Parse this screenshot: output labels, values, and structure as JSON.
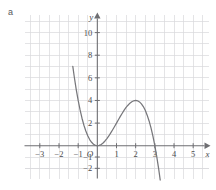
{
  "figure": {
    "part_label": "a"
  },
  "chart_data": {
    "type": "line",
    "title": "",
    "subtitle": "",
    "xlabel": "x",
    "ylabel": "y",
    "origin_label": "O",
    "grid": true,
    "legend": null,
    "xlim": [
      -3.8,
      5.8
    ],
    "ylim": [
      -2.9,
      11.6
    ],
    "xticks": [
      -3,
      -2,
      -1,
      1,
      2,
      3,
      4,
      5
    ],
    "xticklabels": [
      "−3",
      "−2",
      "−1",
      "1",
      "2",
      "3",
      "4",
      "5"
    ],
    "yticks": [
      -2,
      -1,
      2,
      4,
      6,
      8,
      10
    ],
    "yticklabels": [
      "−2",
      "−1",
      "2",
      "4",
      "6",
      "8",
      "10"
    ],
    "x_gridlines": [
      -3.5,
      -2.5,
      -1.5,
      -0.5,
      0.5,
      1.5,
      2.5,
      3.5,
      4.5,
      5.5
    ],
    "y_gridlines": [
      -2,
      1,
      3,
      5,
      7,
      9,
      11
    ],
    "series": [
      {
        "name": "y = x²(3 − x)",
        "expression": "3*x^2 - x^3",
        "color": "#77777b",
        "roots": [
          0,
          3
        ],
        "local_minimum": [
          0,
          0
        ],
        "local_maximum": [
          2,
          4
        ],
        "x": [
          -1.28,
          -1.2,
          -1.1,
          -1.0,
          -0.9,
          -0.8,
          -0.7,
          -0.6,
          -0.5,
          -0.4,
          -0.3,
          -0.2,
          -0.1,
          0.0,
          0.1,
          0.2,
          0.3,
          0.4,
          0.5,
          0.6,
          0.7,
          0.8,
          0.9,
          1.0,
          1.1,
          1.2,
          1.3,
          1.4,
          1.5,
          1.6,
          1.7,
          1.8,
          1.9,
          2.0,
          2.1,
          2.2,
          2.3,
          2.4,
          2.5,
          2.6,
          2.7,
          2.8,
          2.9,
          3.0,
          3.1,
          3.2,
          3.3,
          3.4,
          3.5,
          3.55
        ],
        "y": [
          7.01,
          6.05,
          4.96,
          4.0,
          3.16,
          2.43,
          1.81,
          1.3,
          0.88,
          0.54,
          0.3,
          0.13,
          0.03,
          0.0,
          0.03,
          0.11,
          0.24,
          0.42,
          0.63,
          0.86,
          1.13,
          1.41,
          1.7,
          2.0,
          2.3,
          2.59,
          2.87,
          3.14,
          3.38,
          3.58,
          3.76,
          3.89,
          3.97,
          4.0,
          3.97,
          3.87,
          3.7,
          3.46,
          3.13,
          2.7,
          2.19,
          1.57,
          0.84,
          0.0,
          -0.96,
          -2.05,
          -3.27,
          -4.62,
          -6.13,
          -6.93
        ]
      }
    ]
  }
}
